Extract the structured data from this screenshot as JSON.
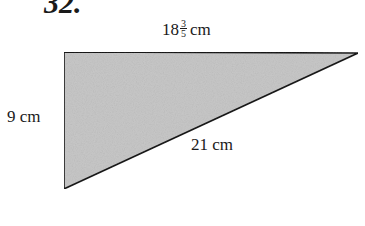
{
  "problem_number": "32.",
  "diagram": {
    "shape": "right-triangle",
    "fill_color": "#c8c8c8",
    "stroke_color": "#1a1a1a",
    "vertices": [
      [
        64,
        52
      ],
      [
        358,
        53
      ],
      [
        64,
        189
      ]
    ],
    "labels": {
      "top": {
        "whole": "18",
        "numerator": "3",
        "denominator": "5",
        "unit": "cm"
      },
      "left": "9 cm",
      "hypotenuse": "21 cm"
    }
  }
}
